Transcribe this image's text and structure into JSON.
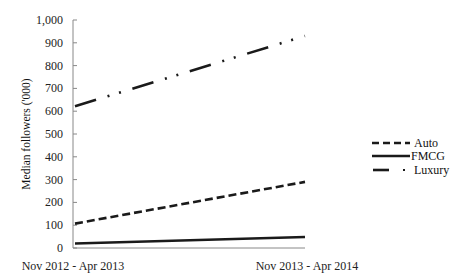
{
  "chart_data": {
    "type": "line",
    "title": "",
    "xlabel": "",
    "ylabel": "Median followers ('000)",
    "categories": [
      "Nov 2012 - Apr 2013",
      "Nov 2013 - Apr 2014"
    ],
    "series": [
      {
        "name": "Auto",
        "values": [
          107,
          290
        ],
        "style": "dashed",
        "color": "#1a1a1a"
      },
      {
        "name": "FMCG",
        "values": [
          20,
          48
        ],
        "style": "solid",
        "color": "#1a1a1a"
      },
      {
        "name": "Luxury",
        "values": [
          622,
          930
        ],
        "style": "dash-dot-dot",
        "color": "#1a1a1a"
      }
    ],
    "ylim": [
      0,
      1000
    ],
    "yticks": [
      0,
      100,
      200,
      300,
      400,
      500,
      600,
      700,
      800,
      900,
      1000
    ],
    "ytick_labels": [
      "0",
      "100",
      "200",
      "300",
      "400",
      "500",
      "600",
      "700",
      "800",
      "900",
      "1,000"
    ],
    "grid": false,
    "legend_position": "right"
  }
}
